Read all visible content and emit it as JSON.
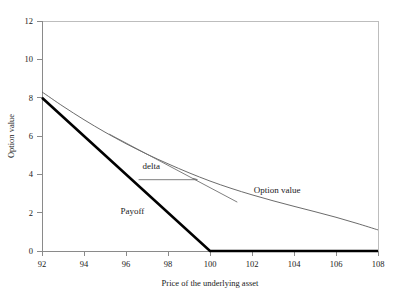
{
  "chart_data": {
    "type": "line",
    "title": "",
    "xlabel": "Price of the underlying asset",
    "ylabel": "Option value",
    "xlim": [
      92,
      108
    ],
    "ylim": [
      0,
      12
    ],
    "xticks": [
      92,
      94,
      96,
      98,
      100,
      102,
      104,
      106,
      108
    ],
    "xtick_labels": [
      "92",
      "94",
      "96",
      "98",
      "100",
      "102",
      "104",
      "106",
      "108"
    ],
    "yticks": [
      0,
      2,
      4,
      6,
      8,
      10,
      12
    ],
    "ytick_labels": [
      "0",
      "2",
      "4",
      "6",
      "8",
      "10",
      "12"
    ],
    "grid": false,
    "legend_position": "inline-annotations",
    "series": [
      {
        "name": "Option value",
        "style": "thin-curve",
        "color": "#5a5a5a",
        "x": [
          92,
          93,
          94,
          95,
          96,
          97,
          98,
          99,
          100,
          101,
          102,
          103,
          104,
          105,
          106,
          107,
          108
        ],
        "values": [
          8.3,
          7.55,
          6.85,
          6.2,
          5.6,
          5.05,
          4.55,
          4.08,
          3.65,
          3.27,
          2.93,
          2.62,
          2.33,
          2.05,
          1.76,
          1.44,
          1.1
        ]
      },
      {
        "name": "Payoff",
        "style": "thick-kinked-line",
        "color": "#000000",
        "x": [
          92,
          100,
          108
        ],
        "values": [
          8.0,
          0.0,
          0.0
        ]
      }
    ],
    "annotations": [
      {
        "name": "delta",
        "label": "delta",
        "label_x": 97.2,
        "label_y": 4.3,
        "ref_line_from_x": 96.6,
        "ref_line_to_x": 99.4,
        "ref_line_y": 3.72,
        "tangent_from_x": 95.2,
        "tangent_from_y": 6.1,
        "tangent_to_x": 101.3,
        "tangent_to_y": 2.55
      },
      {
        "name": "option-value-label",
        "label": "Option value",
        "label_x": 103.2,
        "label_y": 3.05
      },
      {
        "name": "payoff-label",
        "label": "Payoff",
        "label_x": 96.3,
        "label_y": 1.95
      }
    ]
  },
  "figure": {
    "axis_color": "#8a8a8a",
    "frame_color": "#bdbdbd",
    "curve_color": "#5a5a5a",
    "payoff_color": "#000000",
    "background": "#ffffff"
  }
}
